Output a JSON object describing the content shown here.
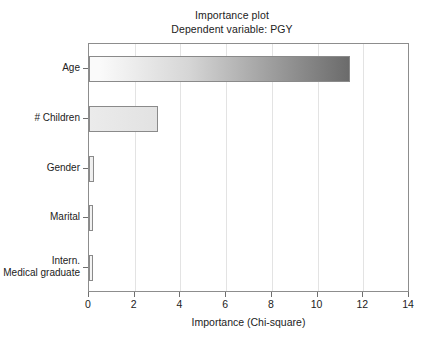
{
  "chart_data": {
    "type": "bar",
    "orientation": "horizontal",
    "title": "Importance plot",
    "subtitle": "Dependent variable: PGY",
    "xlabel": "Importance (Chi-square)",
    "ylabel": "",
    "xlim": [
      0,
      14
    ],
    "xticks": [
      "0",
      "2",
      "4",
      "6",
      "8",
      "10",
      "12",
      "14"
    ],
    "xtick_values": [
      0,
      2,
      4,
      6,
      8,
      10,
      12,
      14
    ],
    "grid": "vertical",
    "legend": "none",
    "categories": [
      "Age",
      "# Children",
      "Gender",
      "Marital",
      "Intern.\nMedical graduate"
    ],
    "values": [
      11.4,
      3.0,
      0.2,
      0.15,
      0.02
    ],
    "bars": [
      {
        "label": "Age",
        "value": 11.4,
        "fill": "gradient",
        "fill_from": "#fafafa",
        "fill_to": "#6b6b6b",
        "border": "#8a8a8a"
      },
      {
        "label": "# Children",
        "value": 3.0,
        "fill": "solid",
        "fill_from": "#ebebeb",
        "fill_to": "#e2e2e2",
        "border": "#8a8a8a"
      },
      {
        "label": "Gender",
        "value": 0.2,
        "fill": "solid",
        "fill_from": "#f2f2f2",
        "fill_to": "#ededed",
        "border": "#8a8a8a"
      },
      {
        "label": "Marital",
        "value": 0.15,
        "fill": "solid",
        "fill_from": "#f4f4f4",
        "fill_to": "#efefef",
        "border": "#8a8a8a"
      },
      {
        "label": "Intern.\nMedical graduate",
        "value": 0.02,
        "fill": "solid",
        "fill_from": "#f6f6f6",
        "fill_to": "#f2f2f2",
        "border": "#8a8a8a"
      }
    ],
    "colors": {
      "background": "#ffffff",
      "axis": "#8d8d8d",
      "gridline": "#e3e3e3",
      "text": "#222222"
    }
  }
}
